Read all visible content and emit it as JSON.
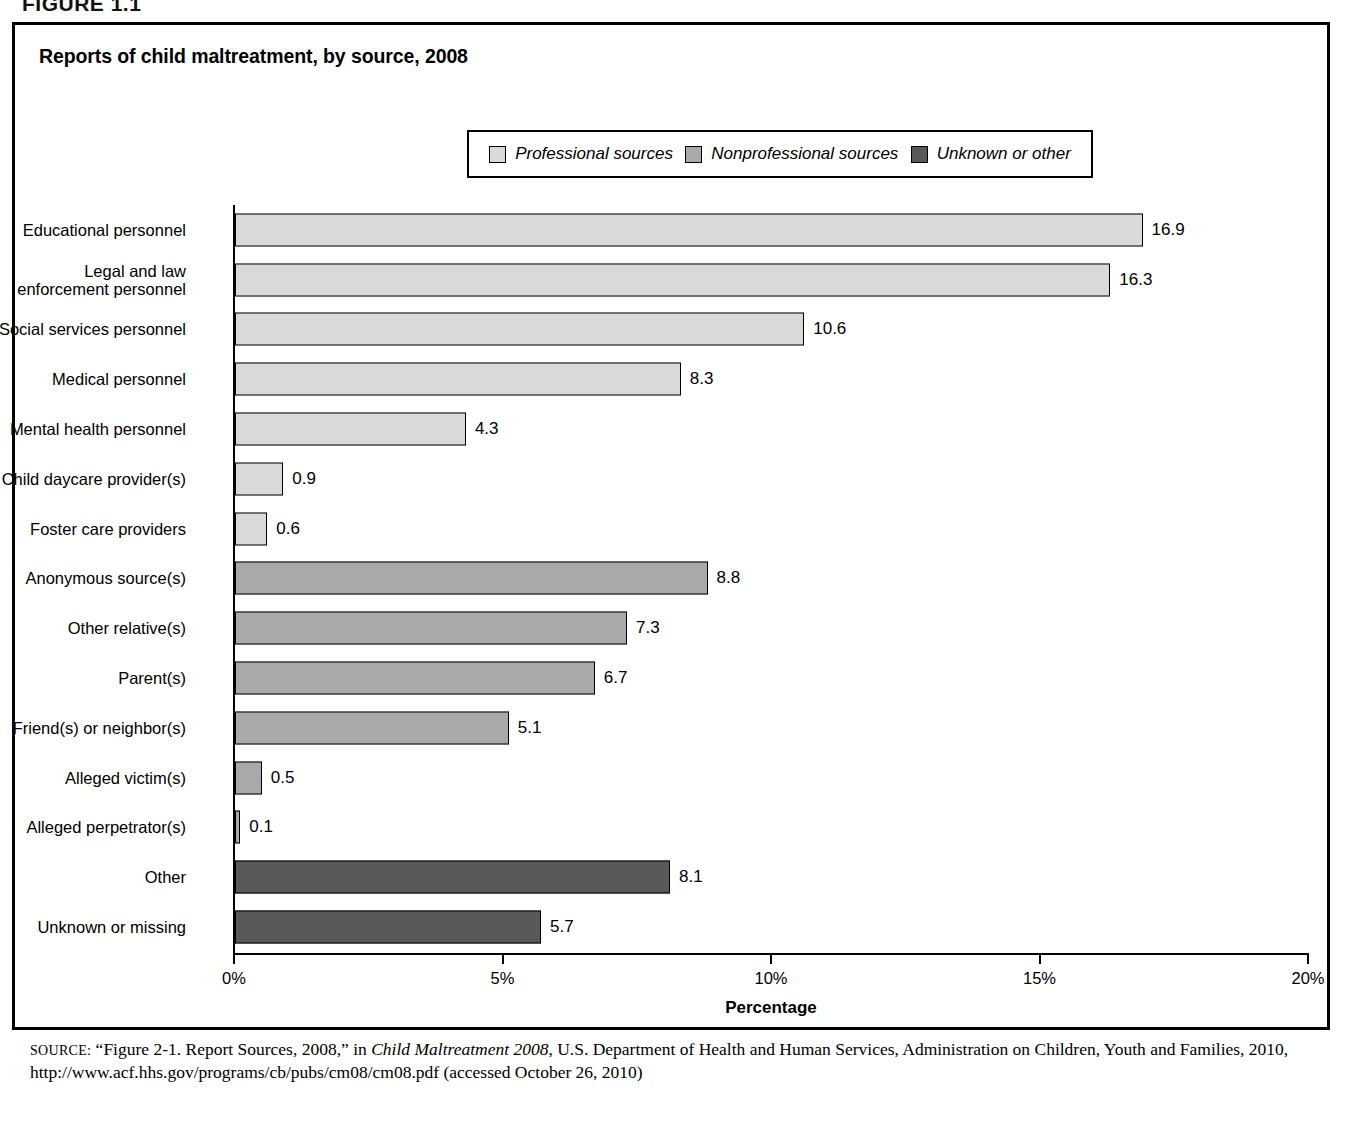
{
  "figure_header": "FIGURE 1.1",
  "figure": {
    "title": "Reports of child maltreatment, by source, 2008"
  },
  "legend": {
    "items": [
      {
        "label": "Professional sources",
        "color": "#d9d9d9"
      },
      {
        "label": "Nonprofessional sources",
        "color": "#a9a9a9"
      },
      {
        "label": "Unknown or other",
        "color": "#595959"
      }
    ]
  },
  "axis": {
    "x_title": "Percentage",
    "ticks": [
      "0%",
      "5%",
      "10%",
      "15%",
      "20%"
    ]
  },
  "chart_data": {
    "type": "bar",
    "orientation": "horizontal",
    "title": "Reports of child maltreatment, by source, 2008",
    "xlabel": "Percentage",
    "ylabel": "",
    "xlim": [
      0,
      20
    ],
    "xticks": [
      0,
      5,
      10,
      15,
      20
    ],
    "xtick_labels": [
      "0%",
      "5%",
      "10%",
      "15%",
      "20%"
    ],
    "grid": false,
    "legend_position": "top-center",
    "legend": [
      "Professional sources",
      "Nonprofessional sources",
      "Unknown or other"
    ],
    "categories": [
      "Educational personnel",
      "Legal and law enforcement personnel",
      "Social services personnel",
      "Medical personnel",
      "Mental health personnel",
      "Child daycare provider(s)",
      "Foster care providers",
      "Anonymous source(s)",
      "Other relative(s)",
      "Parent(s)",
      "Friend(s) or neighbor(s)",
      "Alleged victim(s)",
      "Alleged perpetrator(s)",
      "Other",
      "Unknown or missing"
    ],
    "values": [
      16.9,
      16.3,
      10.6,
      8.3,
      4.3,
      0.9,
      0.6,
      8.8,
      7.3,
      6.7,
      5.1,
      0.5,
      0.1,
      8.1,
      5.7
    ],
    "groups": [
      "Professional sources",
      "Professional sources",
      "Professional sources",
      "Professional sources",
      "Professional sources",
      "Professional sources",
      "Professional sources",
      "Nonprofessional sources",
      "Nonprofessional sources",
      "Nonprofessional sources",
      "Nonprofessional sources",
      "Nonprofessional sources",
      "Nonprofessional sources",
      "Unknown or other",
      "Unknown or other"
    ],
    "bars": [
      {
        "label": "Educational personnel",
        "label_lines": "Educational personnel",
        "value": 16.9,
        "value_text": "16.9",
        "group": "Professional sources",
        "color": "#d9d9d9"
      },
      {
        "label": "Legal and law enforcement personnel",
        "label_lines": "Legal and law\nenforcement personnel",
        "value": 16.3,
        "value_text": "16.3",
        "group": "Professional sources",
        "color": "#d9d9d9"
      },
      {
        "label": "Social services personnel",
        "label_lines": "Social services personnel",
        "value": 10.6,
        "value_text": "10.6",
        "group": "Professional sources",
        "color": "#d9d9d9"
      },
      {
        "label": "Medical personnel",
        "label_lines": "Medical personnel",
        "value": 8.3,
        "value_text": "8.3",
        "group": "Professional sources",
        "color": "#d9d9d9"
      },
      {
        "label": "Mental health personnel",
        "label_lines": "Mental health personnel",
        "value": 4.3,
        "value_text": "4.3",
        "group": "Professional sources",
        "color": "#d9d9d9"
      },
      {
        "label": "Child daycare provider(s)",
        "label_lines": "Child daycare provider(s)",
        "value": 0.9,
        "value_text": "0.9",
        "group": "Professional sources",
        "color": "#d9d9d9"
      },
      {
        "label": "Foster care providers",
        "label_lines": "Foster care providers",
        "value": 0.6,
        "value_text": "0.6",
        "group": "Professional sources",
        "color": "#d9d9d9"
      },
      {
        "label": "Anonymous source(s)",
        "label_lines": "Anonymous source(s)",
        "value": 8.8,
        "value_text": "8.8",
        "group": "Nonprofessional sources",
        "color": "#a9a9a9"
      },
      {
        "label": "Other relative(s)",
        "label_lines": "Other relative(s)",
        "value": 7.3,
        "value_text": "7.3",
        "group": "Nonprofessional sources",
        "color": "#a9a9a9"
      },
      {
        "label": "Parent(s)",
        "label_lines": "Parent(s)",
        "value": 6.7,
        "value_text": "6.7",
        "group": "Nonprofessional sources",
        "color": "#a9a9a9"
      },
      {
        "label": "Friend(s) or neighbor(s)",
        "label_lines": "Friend(s) or neighbor(s)",
        "value": 5.1,
        "value_text": "5.1",
        "group": "Nonprofessional sources",
        "color": "#a9a9a9"
      },
      {
        "label": "Alleged victim(s)",
        "label_lines": "Alleged victim(s)",
        "value": 0.5,
        "value_text": "0.5",
        "group": "Nonprofessional sources",
        "color": "#a9a9a9"
      },
      {
        "label": "Alleged perpetrator(s)",
        "label_lines": "Alleged perpetrator(s)",
        "value": 0.1,
        "value_text": "0.1",
        "group": "Nonprofessional sources",
        "color": "#a9a9a9"
      },
      {
        "label": "Other",
        "label_lines": "Other",
        "value": 8.1,
        "value_text": "8.1",
        "group": "Unknown or other",
        "color": "#595959"
      },
      {
        "label": "Unknown or missing",
        "label_lines": "Unknown or missing",
        "value": 5.7,
        "value_text": "5.7",
        "group": "Unknown or other",
        "color": "#595959"
      }
    ]
  },
  "source": {
    "prefix": "SOURCE:",
    "part1": " “Figure 2-1. Report Sources, 2008,” in ",
    "italic": "Child Maltreatment 2008",
    "part2": ", U.S. Department of Health and Human Services, Administration on Children, Youth and Families, 2010, http://www.acf.hhs.gov/programs/cb/pubs/cm08/cm08.pdf (accessed October 26, 2010)"
  }
}
